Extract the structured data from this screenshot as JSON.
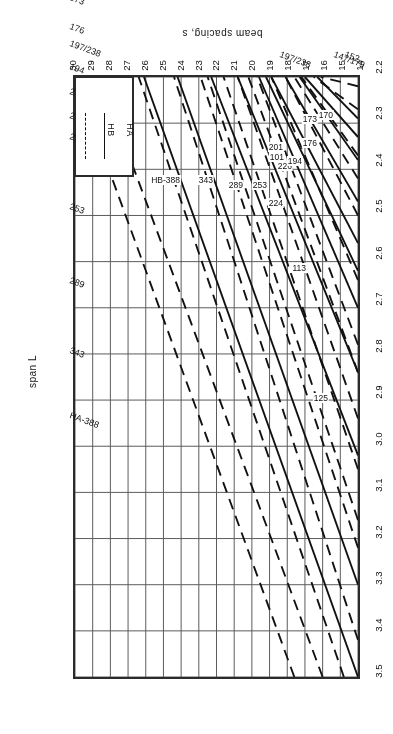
{
  "figure": {
    "orientation": "rotated-180",
    "x_axis": {
      "title": "span L",
      "min": 14,
      "max": 30,
      "ticks": [
        14,
        15,
        16,
        17,
        18,
        19,
        20,
        21,
        22,
        23,
        24,
        25,
        26,
        27,
        28,
        29,
        30
      ]
    },
    "y_axis": {
      "title": "beam spacing, s",
      "min": 2.2,
      "max": 3.5,
      "ticks": [
        "2.2",
        "2.3",
        "2.4",
        "2.5",
        "2.6",
        "2.7",
        "2.8",
        "2.9",
        "3.0",
        "3.1",
        "3.2",
        "3.3",
        "3.4",
        "3.5"
      ]
    },
    "legend": {
      "entries": [
        {
          "label": "HA",
          "style": "dashed"
        },
        {
          "label": "HB",
          "style": "solid"
        }
      ]
    }
  },
  "chart_data": {
    "type": "line",
    "title": "",
    "xlabel": "span L",
    "ylabel": "beam spacing, s",
    "xlim": [
      14,
      30
    ],
    "ylim": [
      2.2,
      3.5
    ],
    "grid": true,
    "legend_position": "top-left",
    "legend": [
      "HA",
      "HB"
    ],
    "axis_note": "Design chart: beam spacing s versus span L with HA (dashed) and HB (solid) loading curves.",
    "left_edge_labels": [
      "HA-388",
      "343",
      "289",
      "253",
      "224",
      "226",
      "201",
      "194",
      "197/238",
      "176",
      "173",
      "170",
      "147/179",
      "152",
      "149",
      "140"
    ],
    "right_edge_labels": [
      "197/238",
      "147/179",
      "152"
    ],
    "inline_curve_labels": [
      "HB-388",
      "343",
      "289",
      "253",
      "224",
      "226",
      "201",
      "194",
      "176",
      "173",
      "170",
      "125",
      "113",
      "101"
    ],
    "series": [
      {
        "name": "HA-388",
        "style": "dashed",
        "label": "HA-388",
        "points": [
          [
            17.6,
            3.5
          ],
          [
            30.0,
            2.2
          ]
        ]
      },
      {
        "name": "HA-343",
        "style": "dashed",
        "label": "343",
        "points": [
          [
            16.0,
            3.5
          ],
          [
            28.6,
            2.2
          ]
        ]
      },
      {
        "name": "HA-289",
        "style": "dashed",
        "label": "289",
        "points": [
          [
            14.8,
            3.5
          ],
          [
            26.4,
            2.2
          ]
        ]
      },
      {
        "name": "HA-253",
        "style": "dashed",
        "label": "253",
        "points": [
          [
            14.0,
            3.42
          ],
          [
            24.4,
            2.2
          ]
        ]
      },
      {
        "name": "HA-224",
        "style": "dashed",
        "label": "224",
        "points": [
          [
            14.0,
            3.22
          ],
          [
            22.9,
            2.2
          ]
        ]
      },
      {
        "name": "HA-226",
        "style": "dashed",
        "label": "226",
        "points": [
          [
            14.0,
            3.16
          ],
          [
            22.5,
            2.2
          ]
        ]
      },
      {
        "name": "HA-201",
        "style": "dashed",
        "label": "201",
        "points": [
          [
            14.0,
            3.05
          ],
          [
            21.6,
            2.2
          ]
        ]
      },
      {
        "name": "HA-194",
        "style": "dashed",
        "label": "194",
        "points": [
          [
            14.0,
            2.94
          ],
          [
            20.8,
            2.2
          ]
        ]
      },
      {
        "name": "HA-197/238",
        "style": "dashed",
        "label": "197/238",
        "points": [
          [
            14.0,
            2.84
          ],
          [
            20.2,
            2.2
          ]
        ]
      },
      {
        "name": "HA-176",
        "style": "dashed",
        "label": "176",
        "points": [
          [
            14.0,
            2.78
          ],
          [
            19.7,
            2.2
          ]
        ]
      },
      {
        "name": "HA-173",
        "style": "dashed",
        "label": "173",
        "points": [
          [
            14.0,
            2.64
          ],
          [
            18.9,
            2.2
          ]
        ]
      },
      {
        "name": "HA-170",
        "style": "dashed",
        "label": "170",
        "points": [
          [
            14.0,
            2.5
          ],
          [
            18.1,
            2.2
          ]
        ]
      },
      {
        "name": "HA-147/179",
        "style": "dashed",
        "label": "147/179",
        "points": [
          [
            14.0,
            2.42
          ],
          [
            17.6,
            2.2
          ]
        ]
      },
      {
        "name": "HA-152",
        "style": "dashed",
        "label": "152",
        "points": [
          [
            14.0,
            2.37
          ],
          [
            17.2,
            2.2
          ]
        ]
      },
      {
        "name": "HA-149",
        "style": "dashed",
        "label": "149",
        "points": [
          [
            14.0,
            2.27
          ],
          [
            16.5,
            2.2
          ]
        ]
      },
      {
        "name": "HA-140",
        "style": "dashed",
        "label": "140",
        "points": [
          [
            14.0,
            2.22
          ],
          [
            16.1,
            2.2
          ]
        ]
      },
      {
        "name": "HB-388",
        "style": "solid",
        "label": "HB-388",
        "points": [
          [
            14.0,
            3.5
          ],
          [
            26.1,
            2.2
          ]
        ]
      },
      {
        "name": "HB-343",
        "style": "solid",
        "label": "343",
        "points": [
          [
            14.0,
            3.3
          ],
          [
            24.2,
            2.2
          ]
        ]
      },
      {
        "name": "HB-289",
        "style": "solid",
        "label": "289",
        "points": [
          [
            14.0,
            3.02
          ],
          [
            22.3,
            2.2
          ]
        ]
      },
      {
        "name": "HB-253",
        "style": "solid",
        "label": "253",
        "points": [
          [
            14.0,
            2.84
          ],
          [
            20.8,
            2.2
          ]
        ]
      },
      {
        "name": "HB-224",
        "style": "solid",
        "label": "224",
        "points": [
          [
            14.0,
            2.7
          ],
          [
            19.6,
            2.2
          ]
        ]
      },
      {
        "name": "HB-226",
        "style": "solid",
        "label": "226",
        "points": [
          [
            14.0,
            2.62
          ],
          [
            19.2,
            2.2
          ]
        ]
      },
      {
        "name": "HB-201",
        "style": "solid",
        "label": "201",
        "points": [
          [
            14.0,
            2.56
          ],
          [
            18.9,
            2.2
          ]
        ]
      },
      {
        "name": "HB-194",
        "style": "solid",
        "label": "194",
        "points": [
          [
            14.0,
            2.47
          ],
          [
            18.1,
            2.2
          ]
        ]
      },
      {
        "name": "HB-176",
        "style": "solid",
        "label": "176",
        "points": [
          [
            14.0,
            2.38
          ],
          [
            17.3,
            2.2
          ]
        ]
      },
      {
        "name": "HB-173",
        "style": "solid",
        "label": "173",
        "points": [
          [
            14.0,
            2.33
          ],
          [
            17.0,
            2.2
          ]
        ]
      },
      {
        "name": "HB-170",
        "style": "solid",
        "label": "170",
        "points": [
          [
            14.0,
            2.29
          ],
          [
            16.3,
            2.2
          ]
        ]
      },
      {
        "name": "HB-125",
        "style": "solid",
        "label": "125",
        "points": [
          [
            14.0,
            2.98
          ],
          [
            14.0,
            2.98
          ]
        ]
      },
      {
        "name": "HB-113",
        "style": "solid",
        "label": "113",
        "points": [
          [
            14.0,
            2.66
          ],
          [
            14.0,
            2.66
          ]
        ]
      },
      {
        "name": "HB-101",
        "style": "solid",
        "label": "101",
        "points": [
          [
            14.0,
            2.38
          ],
          [
            14.0,
            2.38
          ]
        ]
      }
    ]
  }
}
